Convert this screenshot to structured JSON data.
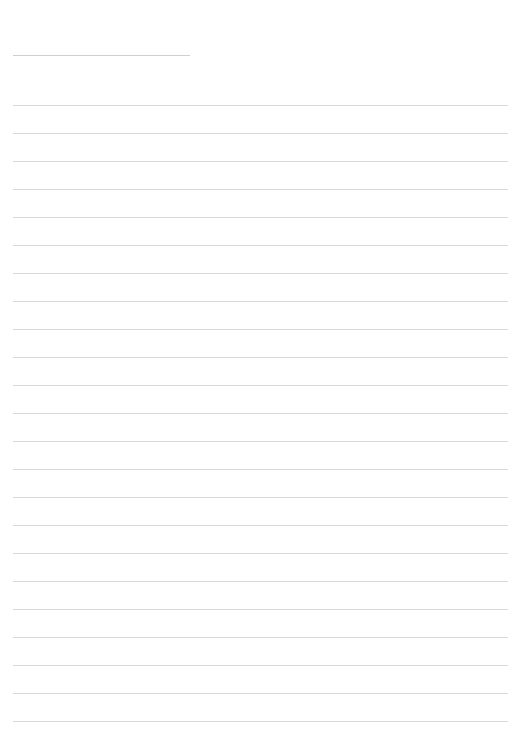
{
  "document": {
    "type": "lined-paper-template",
    "title": "Lined Paper Template",
    "background_color": "#ffffff",
    "width": 522,
    "height": 755
  },
  "rules": {
    "line_color": "#d9d9db",
    "line_thickness_px": 1,
    "line_spacing_px": 28,
    "left_margin_px": 13,
    "right_edge_px": 508
  },
  "header_rule": {
    "name": "header-field-rule",
    "x": 13,
    "y": 55,
    "width": 177,
    "color": "#cfcfd2"
  },
  "writing_lines": {
    "count": 23,
    "first_line_y": 105,
    "spacing": 28,
    "x_start": 13,
    "x_end": 508,
    "y_positions": [
      105,
      133,
      161,
      189,
      217,
      245,
      273,
      301,
      329,
      357,
      385,
      413,
      441,
      469,
      497,
      525,
      553,
      581,
      609,
      637,
      665,
      693,
      721
    ]
  },
  "accessibility": {
    "page_label": "Blank lined paper page",
    "header_rule_label": "Header entry line",
    "writing_line_label": "Writing line"
  }
}
